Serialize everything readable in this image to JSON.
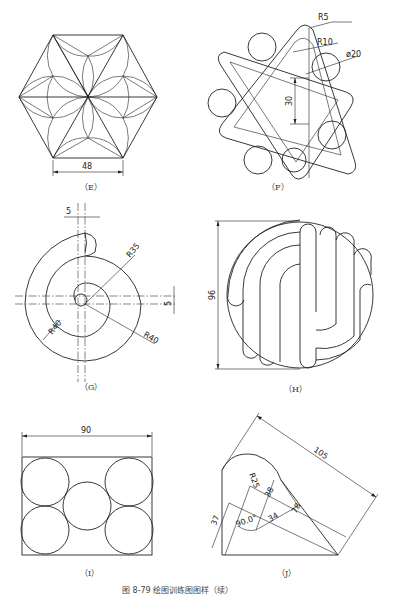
{
  "figures": [
    {
      "id": "E",
      "label": "（E）",
      "dimensions": [
        "48"
      ],
      "description": "hexagon with six-petal arc pattern"
    },
    {
      "id": "F",
      "label": "（F）",
      "dimensions": [
        "R5",
        "R10",
        "ø20",
        "30"
      ],
      "description": "two overlapping rounded triangles with six circles"
    },
    {
      "id": "G",
      "label": "（G）",
      "dimensions": [
        "5",
        "R35",
        "5",
        "R40",
        "R40"
      ],
      "description": "spiral curve with centerlines"
    },
    {
      "id": "H",
      "label": "（H）",
      "dimensions": [
        "96"
      ],
      "description": "circle with interlocking rounded slots"
    },
    {
      "id": "I",
      "label": "（I）",
      "dimensions": [
        "90"
      ],
      "description": "rectangle with five tangent circles"
    },
    {
      "id": "J",
      "label": "（J）",
      "dimensions": [
        "105",
        "R25",
        "38",
        "34",
        "78",
        "90.0°",
        "37"
      ],
      "description": "tilted profile with arc and angled dimensions"
    }
  ],
  "caption": "图 8-79   绘图训练图图样（续）",
  "colors": {
    "line": "#222222",
    "background": "#ffffff"
  }
}
